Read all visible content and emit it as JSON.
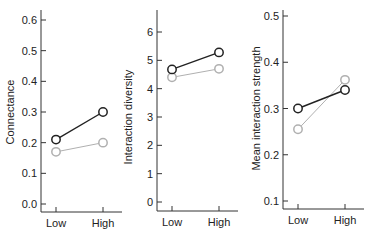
{
  "chart_data": [
    {
      "type": "line",
      "title": "",
      "xlabel": "",
      "ylabel": "Connectance",
      "categories": [
        "Low",
        "High"
      ],
      "ylim": [
        0.0,
        0.6
      ],
      "yticks": [
        "0.0",
        "0.1",
        "0.2",
        "0.3",
        "0.4",
        "0.5",
        "0.6"
      ],
      "grid": false,
      "series": [
        {
          "name": "black",
          "color": "#222222",
          "values": [
            0.21,
            0.3
          ]
        },
        {
          "name": "gray",
          "color": "#b0b0b0",
          "values": [
            0.17,
            0.2
          ]
        }
      ]
    },
    {
      "type": "line",
      "title": "",
      "xlabel": "",
      "ylabel": "Interaction diversity",
      "categories": [
        "Low",
        "High"
      ],
      "ylim": [
        0,
        6
      ],
      "yticks": [
        "0",
        "1",
        "2",
        "3",
        "4",
        "5",
        "6"
      ],
      "grid": false,
      "series": [
        {
          "name": "black",
          "color": "#222222",
          "values": [
            4.68,
            5.28
          ]
        },
        {
          "name": "gray",
          "color": "#b0b0b0",
          "values": [
            4.4,
            4.7
          ]
        }
      ]
    },
    {
      "type": "line",
      "title": "",
      "xlabel": "",
      "ylabel": "Mean interaction strength",
      "categories": [
        "Low",
        "High"
      ],
      "ylim": [
        0.1,
        0.5
      ],
      "yticks": [
        "0.1",
        "0.2",
        "0.3",
        "0.4",
        "0.5"
      ],
      "grid": false,
      "series": [
        {
          "name": "black",
          "color": "#222222",
          "values": [
            0.3,
            0.34
          ]
        },
        {
          "name": "gray",
          "color": "#b0b0b0",
          "values": [
            0.255,
            0.362
          ]
        }
      ]
    }
  ]
}
